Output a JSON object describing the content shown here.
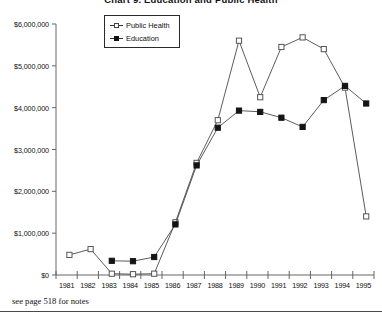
{
  "chart_data": {
    "type": "line",
    "title": "Chart 9. Education and Public Health",
    "xlabel": "",
    "ylabel": "",
    "grid": false,
    "legend_position": "top-left-inside",
    "ylim": [
      0,
      6000000
    ],
    "ytick_labels": [
      "$0",
      "$1,000,000",
      "$2,000,000",
      "$3,000,000",
      "$4,000,000",
      "$5,000,000",
      "$6,000,000"
    ],
    "ytick_values": [
      0,
      1000000,
      2000000,
      3000000,
      4000000,
      5000000,
      6000000
    ],
    "categories": [
      "1981",
      "1982",
      "1983",
      "1984",
      "1985",
      "1986",
      "1987",
      "1988",
      "1989",
      "1990",
      "1991",
      "1992",
      "1993",
      "1994",
      "1995"
    ],
    "series": [
      {
        "name": "Public Health",
        "marker": "open-square",
        "values": [
          480000,
          620000,
          30000,
          20000,
          30000,
          1260000,
          2680000,
          3700000,
          5600000,
          4250000,
          5450000,
          5680000,
          5400000,
          4480000,
          1400000
        ]
      },
      {
        "name": "Education",
        "marker": "filled-square",
        "values": [
          null,
          null,
          340000,
          330000,
          430000,
          1210000,
          2620000,
          3520000,
          3930000,
          3900000,
          3760000,
          3540000,
          4180000,
          4520000,
          4100000
        ]
      }
    ],
    "footnote": "see page 518 for notes"
  },
  "legend": {
    "items": [
      {
        "label": "Public Health"
      },
      {
        "label": "Education"
      }
    ]
  },
  "colors": {
    "series_public_health": "#555555",
    "series_education": "#111111",
    "axis": "#555555",
    "background": "#ffffff"
  }
}
